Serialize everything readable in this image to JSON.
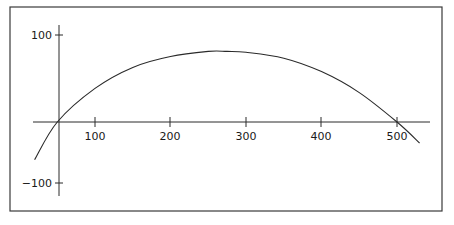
{
  "chart_data": {
    "type": "line",
    "title": "",
    "xlabel": "",
    "ylabel": "",
    "x_ticks": [
      100,
      200,
      300,
      400,
      500
    ],
    "x_tick_labels": [
      "100",
      "200",
      "300",
      "400",
      "500"
    ],
    "y_ticks": [
      100,
      -100
    ],
    "y_tick_labels": [
      "100",
      "−100"
    ],
    "xlim": [
      0,
      560
    ],
    "ylim": [
      -130,
      130
    ],
    "grid": false,
    "legend": null,
    "series": [
      {
        "name": "curve",
        "description": "Downward-opening parabola crossing the x-axis near x≈50 and x≈500, peaking near x≈275",
        "x": [
          20,
          50,
          100,
          150,
          200,
          250,
          275,
          300,
          350,
          400,
          450,
          500,
          530
        ],
        "y": [
          -45,
          0,
          40,
          65,
          78,
          84,
          84,
          83,
          76,
          60,
          35,
          0,
          -25
        ]
      }
    ],
    "colors": {
      "line": "#2a2a2a",
      "frame": "#3a3a3a",
      "background": "#ffffff"
    }
  }
}
